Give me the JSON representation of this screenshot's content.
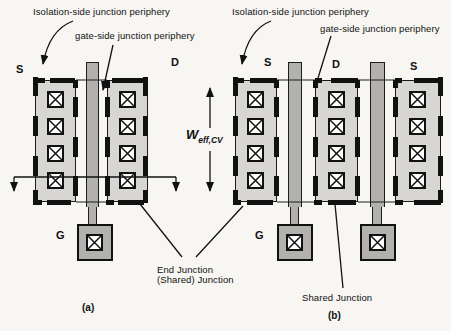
{
  "figure": {
    "panel_a": {
      "caption": "(a)",
      "annotations": {
        "isolation": "Isolation-side junction periphery",
        "gate_side": "gate-side junction periphery",
        "end_junction_line1": "End Junction",
        "end_junction_line2": "(Shared) Junction"
      },
      "terminals": {
        "source": "S",
        "drain": "D",
        "gate": "G"
      }
    },
    "panel_b": {
      "caption": "(b)",
      "annotations": {
        "isolation": "Isolation-side junction periphery",
        "gate_side": "gate-side junction periphery",
        "shared_junction": "Shared Junction",
        "weff_base": "W",
        "weff_sub": "eff,CV"
      },
      "terminals": {
        "source_left": "S",
        "drain": "D",
        "source_right": "S",
        "gate": "G"
      }
    },
    "colors": {
      "active_fill": "#d7d6d3",
      "gate_fill": "#b2b1ae",
      "line": "#111111",
      "contact_fill": "#ffffff"
    }
  }
}
